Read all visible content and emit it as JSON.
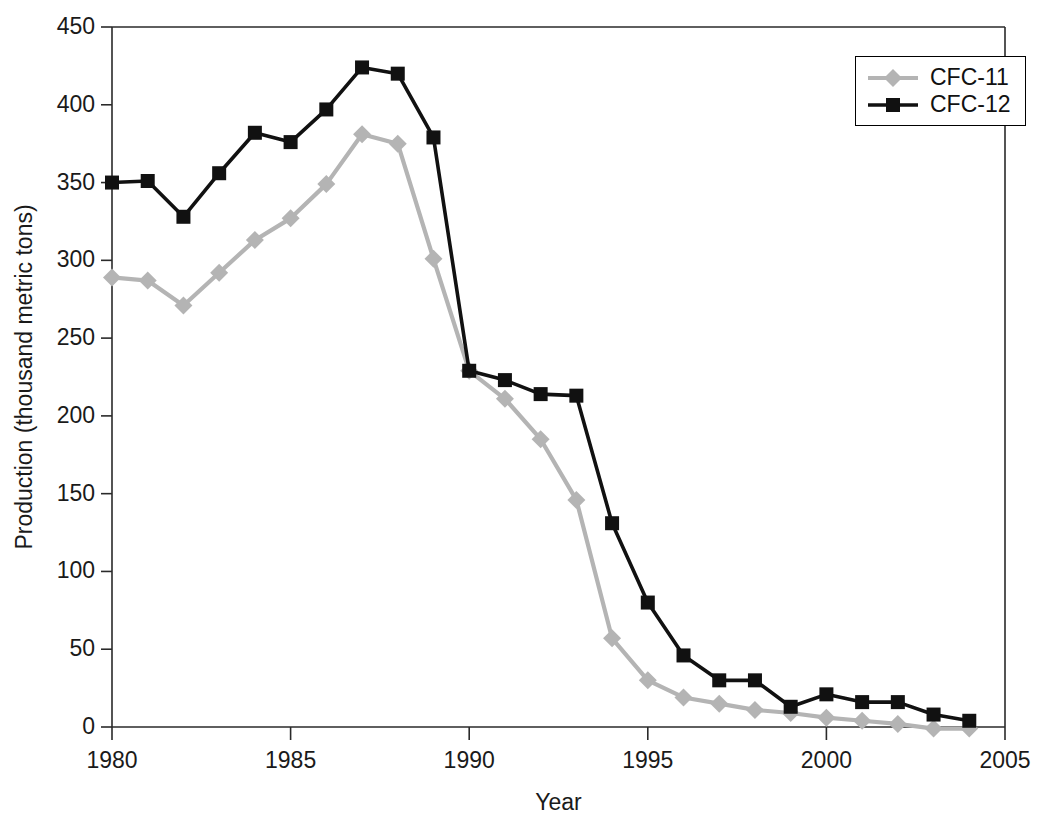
{
  "chart_data": {
    "type": "line",
    "title": "",
    "xlabel": "Year",
    "ylabel": "Production (thousand metric tons)",
    "xlim": [
      1980,
      2005
    ],
    "ylim": [
      0,
      450
    ],
    "xticks": [
      1980,
      1985,
      1990,
      1995,
      2000,
      2005
    ],
    "yticks": [
      0,
      50,
      100,
      150,
      200,
      250,
      300,
      350,
      400,
      450
    ],
    "grid": false,
    "legend_position": "top-right",
    "x": [
      1980,
      1981,
      1982,
      1983,
      1984,
      1985,
      1986,
      1987,
      1988,
      1989,
      1990,
      1991,
      1992,
      1993,
      1994,
      1995,
      1996,
      1997,
      1998,
      1999,
      2000,
      2001,
      2002,
      2003,
      2004
    ],
    "series": [
      {
        "name": "CFC-11",
        "color": "#b4b4b4",
        "marker": "diamond",
        "values": [
          289,
          287,
          271,
          292,
          313,
          327,
          349,
          381,
          375,
          301,
          229,
          211,
          185,
          146,
          57,
          30,
          19,
          15,
          11,
          9,
          6,
          4,
          2,
          -1,
          -1
        ]
      },
      {
        "name": "CFC-12",
        "color": "#111111",
        "marker": "square",
        "values": [
          350,
          351,
          328,
          356,
          382,
          376,
          397,
          424,
          420,
          379,
          229,
          223,
          214,
          213,
          131,
          80,
          46,
          30,
          30,
          13,
          21,
          16,
          16,
          8,
          4
        ]
      }
    ]
  },
  "axes": {
    "ytick_labels": [
      "450",
      "400",
      "350",
      "300",
      "250",
      "200",
      "150",
      "100",
      "50",
      "0"
    ],
    "xtick_labels": [
      "1980",
      "1985",
      "1990",
      "1995",
      "2000",
      "2005"
    ],
    "x_axis_title": "Year",
    "y_axis_title": "Production (thousand metric tons)"
  },
  "legend": {
    "entries": [
      {
        "label": "CFC-11",
        "color": "#b4b4b4",
        "marker": "diamond"
      },
      {
        "label": "CFC-12",
        "color": "#111111",
        "marker": "square"
      }
    ]
  }
}
